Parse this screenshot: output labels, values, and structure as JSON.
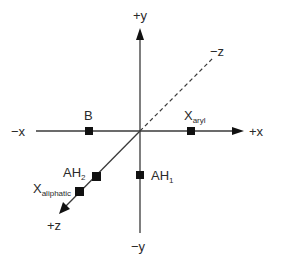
{
  "diagram": {
    "title": "",
    "colors": {
      "axis": "#3a3a3a",
      "marker": "#111111",
      "text": "#2a2a2a",
      "background": "#ffffff"
    },
    "axes": {
      "plus_y": "+y",
      "minus_y": "−y",
      "plus_x": "+x",
      "minus_x": "−x",
      "plus_z": "+z",
      "minus_z": "−z"
    },
    "points": [
      {
        "id": "B",
        "label": "B",
        "sub": "",
        "axis": "-x"
      },
      {
        "id": "X_aryl",
        "label": "X",
        "sub": "aryl",
        "axis": "+x"
      },
      {
        "id": "AH2",
        "label": "AH",
        "sub": "2",
        "axis": "+z"
      },
      {
        "id": "X_aliphatic",
        "label": "X",
        "sub": "aliphatic",
        "axis": "+z"
      },
      {
        "id": "AH1",
        "label": "AH",
        "sub": "1",
        "axis": "-y"
      }
    ]
  }
}
